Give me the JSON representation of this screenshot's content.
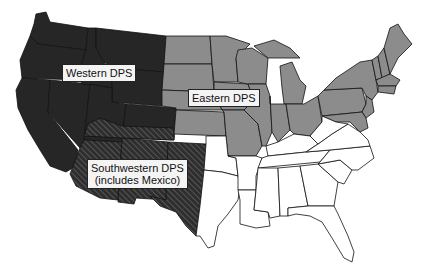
{
  "map": {
    "regions": [
      {
        "id": "western",
        "label": "Western DPS",
        "fill": "#262626",
        "pattern": "solid"
      },
      {
        "id": "eastern",
        "label": "Eastern DPS",
        "fill": "#8c8c8c",
        "pattern": "solid"
      },
      {
        "id": "southwestern",
        "label_line1": "Southwestern DPS",
        "label_line2": "(includes Mexico)",
        "fill": "#2e2e2e",
        "pattern": "diagonal-hatch"
      },
      {
        "id": "unassigned",
        "label": "",
        "fill": "#ffffff",
        "pattern": "solid"
      }
    ],
    "colors": {
      "border": "#1a1a1a",
      "background": "#ffffff",
      "hatch_line": "#5a5a5a",
      "label_bg": "#f4f4f4"
    }
  }
}
